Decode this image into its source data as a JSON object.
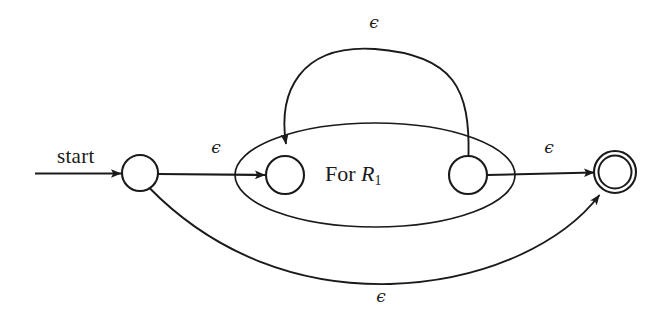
{
  "figure": {
    "kind": "nfa-state-diagram",
    "caption_text": "",
    "background_color": "#ffffff",
    "stroke_color": "#1a1a1a"
  },
  "labels": {
    "start": "start",
    "inner_block": "For R",
    "inner_block_subscript": "1",
    "epsilon": "ϵ"
  },
  "states": [
    {
      "name": "start-state",
      "type": "normal",
      "cx": 140,
      "cy": 173,
      "r": 18
    },
    {
      "name": "subautomaton-start-state",
      "type": "normal",
      "cx": 285,
      "cy": 175,
      "r": 19
    },
    {
      "name": "subautomaton-accept-state",
      "type": "normal",
      "cx": 468,
      "cy": 175,
      "r": 19
    },
    {
      "name": "final-accept-state",
      "type": "accepting",
      "cx": 615,
      "cy": 172,
      "r": 21,
      "r_inner": 16.5
    }
  ],
  "sub_block": {
    "name": "for-r1-ellipse",
    "cx": 375,
    "cy": 175,
    "rx": 140,
    "ry": 52,
    "label_x": 325,
    "label_y": 164
  },
  "transitions": [
    {
      "name": "start-arrow",
      "from": "",
      "to": "start-state",
      "label": "",
      "label_x": null,
      "label_y": null
    },
    {
      "name": "epsilon-start-to-sub",
      "from": "start-state",
      "to": "subautomaton-start-state",
      "label": "ϵ",
      "label_x": 215,
      "label_y": 148
    },
    {
      "name": "epsilon-sub-to-accept",
      "from": "subautomaton-accept-state",
      "to": "final-accept-state",
      "label": "ϵ",
      "label_x": 548,
      "label_y": 148
    },
    {
      "name": "epsilon-loop-back",
      "from": "subautomaton-accept-state",
      "to": "subautomaton-start-state",
      "label": "ϵ",
      "label_x": 373,
      "label_y": 22
    },
    {
      "name": "epsilon-bypass",
      "from": "start-state",
      "to": "final-accept-state",
      "label": "ϵ",
      "label_x": 380,
      "label_y": 294
    }
  ]
}
